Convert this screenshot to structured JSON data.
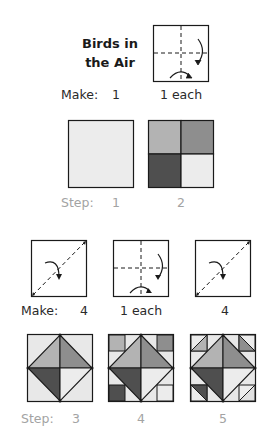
{
  "title": {
    "line1": "Birds in",
    "line2": "the Air"
  },
  "colors": {
    "background": "#e8e8e8",
    "light": "#ececec",
    "medium_light": "#b3b3b3",
    "medium": "#8e8e8e",
    "dark": "#4f4f4f",
    "outline": "#1a1a1a",
    "step_label": "#a3a3a3"
  },
  "row1": {
    "fold_diagram": {
      "icon": "fold-quarters-icon",
      "make_count": "1 each"
    },
    "make_label": "Make:",
    "make_first": "1",
    "steps": [
      {
        "label": "Step:",
        "number": "1",
        "block": "plain-square"
      },
      {
        "number": "2",
        "block": "four-patch"
      }
    ]
  },
  "row2": {
    "make_label": "Make:",
    "fold_diagrams": [
      {
        "icon": "fold-diagonal-icon",
        "make_count": "4"
      },
      {
        "icon": "fold-quarters-icon",
        "make_count": "1 each"
      },
      {
        "icon": "fold-diagonal-icon",
        "make_count": "4"
      }
    ],
    "steps": [
      {
        "label": "Step:",
        "number": "3",
        "block": "square-in-square"
      },
      {
        "number": "4",
        "block": "square-in-square-corners"
      },
      {
        "number": "5",
        "block": "birds-in-the-air"
      }
    ]
  }
}
